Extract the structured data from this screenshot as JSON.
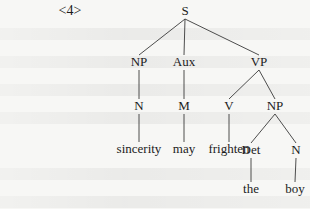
{
  "example_label": "<4>",
  "tree": {
    "nodes": [
      {
        "id": "S",
        "label": "S",
        "type": "category",
        "parent": null
      },
      {
        "id": "NP1",
        "label": "NP",
        "type": "category",
        "parent": "S"
      },
      {
        "id": "Aux",
        "label": "Aux",
        "type": "category",
        "parent": "S"
      },
      {
        "id": "VP",
        "label": "VP",
        "type": "category",
        "parent": "S"
      },
      {
        "id": "N1",
        "label": "N",
        "type": "category",
        "parent": "NP1"
      },
      {
        "id": "M",
        "label": "M",
        "type": "category",
        "parent": "Aux"
      },
      {
        "id": "V",
        "label": "V",
        "type": "category",
        "parent": "VP"
      },
      {
        "id": "NP2",
        "label": "NP",
        "type": "category",
        "parent": "VP"
      },
      {
        "id": "w1",
        "label": "sincerity",
        "type": "word",
        "parent": "N1"
      },
      {
        "id": "w2",
        "label": "may",
        "type": "word",
        "parent": "M"
      },
      {
        "id": "w3",
        "label": "frighten",
        "type": "word",
        "parent": "V"
      },
      {
        "id": "Det",
        "label": "Det",
        "type": "category",
        "parent": "NP2"
      },
      {
        "id": "N2",
        "label": "N",
        "type": "category",
        "parent": "NP2"
      },
      {
        "id": "w4",
        "label": "the",
        "type": "word",
        "parent": "Det"
      },
      {
        "id": "w5",
        "label": "boy",
        "type": "word",
        "parent": "N2"
      }
    ]
  }
}
